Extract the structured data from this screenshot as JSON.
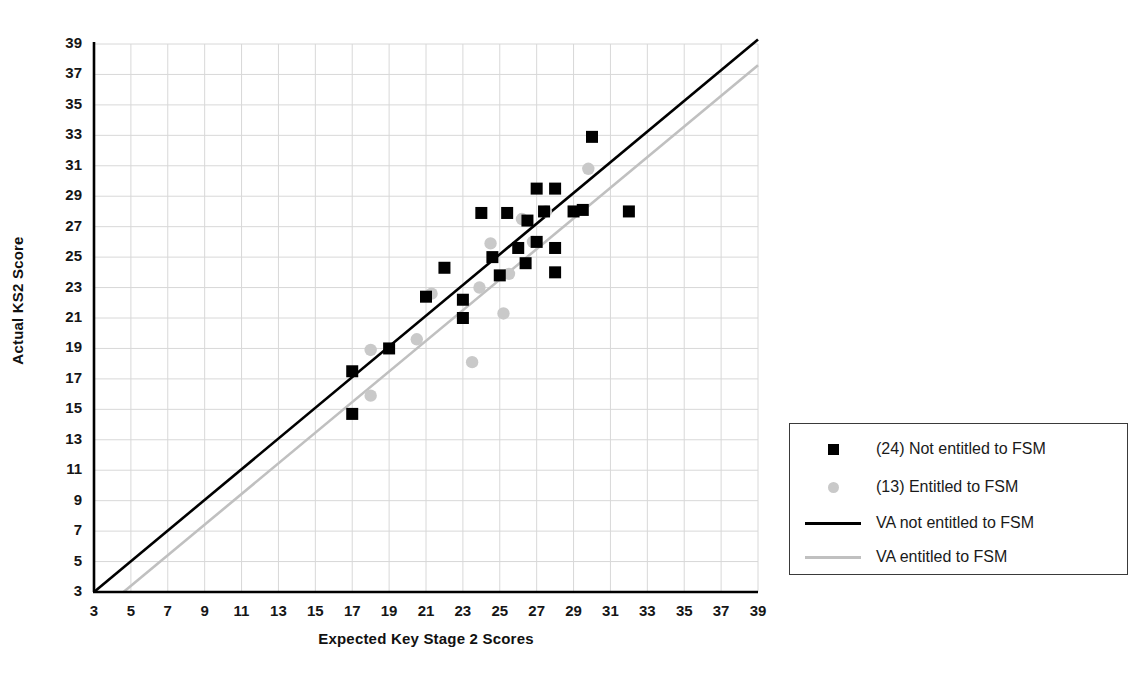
{
  "chart_data": {
    "type": "scatter",
    "title": "",
    "xlabel": "Expected Key Stage 2 Scores",
    "ylabel": "Actual KS2 Score",
    "xlim": [
      3,
      39
    ],
    "ylim": [
      3,
      39
    ],
    "xticks": [
      3,
      5,
      7,
      9,
      11,
      13,
      15,
      17,
      19,
      21,
      23,
      25,
      27,
      29,
      31,
      33,
      35,
      37,
      39
    ],
    "yticks": [
      3,
      5,
      7,
      9,
      11,
      13,
      15,
      17,
      19,
      21,
      23,
      25,
      27,
      29,
      31,
      33,
      35,
      37,
      39
    ],
    "grid": true,
    "legend_position": "right",
    "series": [
      {
        "name": "(24) Not entitled to FSM",
        "marker": "square",
        "color": "#000000",
        "count": 24,
        "points": [
          [
            17,
            17.5
          ],
          [
            17,
            14.7
          ],
          [
            19,
            19.0
          ],
          [
            21,
            22.4
          ],
          [
            22,
            24.3
          ],
          [
            23,
            22.2
          ],
          [
            23,
            21.0
          ],
          [
            24,
            27.9
          ],
          [
            24.6,
            25.0
          ],
          [
            25,
            23.8
          ],
          [
            25.4,
            27.9
          ],
          [
            26,
            25.6
          ],
          [
            26.4,
            24.6
          ],
          [
            26.5,
            27.4
          ],
          [
            27,
            26.0
          ],
          [
            27,
            29.5
          ],
          [
            27.4,
            28.0
          ],
          [
            28,
            29.5
          ],
          [
            28,
            25.6
          ],
          [
            28,
            24.0
          ],
          [
            29,
            28.0
          ],
          [
            29.5,
            28.1
          ],
          [
            30,
            32.9
          ],
          [
            32,
            28.0
          ]
        ]
      },
      {
        "name": "(13) Entitled to FSM",
        "marker": "circle",
        "color": "#c9c9c9",
        "count": 13,
        "points": [
          [
            18,
            18.9
          ],
          [
            18,
            15.9
          ],
          [
            20.5,
            19.6
          ],
          [
            21.3,
            22.6
          ],
          [
            23.5,
            18.1
          ],
          [
            23.9,
            23.0
          ],
          [
            24.5,
            25.9
          ],
          [
            25.2,
            21.3
          ],
          [
            25.5,
            23.9
          ],
          [
            26.2,
            27.5
          ],
          [
            26.8,
            26.0
          ],
          [
            27.5,
            28.0
          ],
          [
            29.8,
            30.8
          ]
        ]
      }
    ],
    "lines": [
      {
        "name": "VA not entitled to FSM",
        "color": "#000000",
        "width": 2.6,
        "from": [
          3,
          3
        ],
        "to": [
          39,
          39.3
        ]
      },
      {
        "name": "VA entitled to FSM",
        "color": "#c0c0c0",
        "width": 2.6,
        "from": [
          4.6,
          3
        ],
        "to": [
          39,
          37.6
        ]
      }
    ]
  },
  "legend": {
    "items": [
      {
        "label": "(24) Not entitled to FSM",
        "key": "square-marker-icon",
        "color": "#000000"
      },
      {
        "label": "(13) Entitled to FSM",
        "key": "circle-marker-icon",
        "color": "#c9c9c9"
      },
      {
        "label": "VA not entitled to FSM",
        "key": "line-swatch-icon",
        "color": "#000000"
      },
      {
        "label": "VA entitled to FSM",
        "key": "line-swatch-icon",
        "color": "#c0c0c0"
      }
    ]
  },
  "axes": {
    "x_title": "Expected Key Stage 2 Scores",
    "y_title": "Actual KS2 Score",
    "x_tick_labels": [
      "3",
      "5",
      "7",
      "9",
      "11",
      "13",
      "15",
      "17",
      "19",
      "21",
      "23",
      "25",
      "27",
      "29",
      "31",
      "33",
      "35",
      "37",
      "39"
    ],
    "y_tick_labels": [
      "3",
      "5",
      "7",
      "9",
      "11",
      "13",
      "15",
      "17",
      "19",
      "21",
      "23",
      "25",
      "27",
      "29",
      "31",
      "33",
      "35",
      "37",
      "39"
    ]
  },
  "colors": {
    "axis": "#000000",
    "grid": "#d8d8d8",
    "black_series": "#000000",
    "grey_series": "#c9c9c9"
  }
}
